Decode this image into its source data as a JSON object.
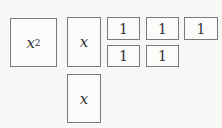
{
  "tiles": {
    "x_squared": {
      "var": "x",
      "exp": "2"
    },
    "x_tiles": [
      {
        "label": "x"
      },
      {
        "label": "x"
      }
    ],
    "unit_tiles": [
      {
        "label": "1"
      },
      {
        "label": "1"
      },
      {
        "label": "1"
      },
      {
        "label": "1"
      },
      {
        "label": "1"
      }
    ]
  }
}
